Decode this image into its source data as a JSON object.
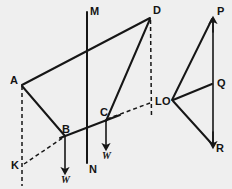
{
  "figure": {
    "background_color": "#efefef",
    "ink_color": "#161616",
    "width": 232,
    "height": 189,
    "labels": {
      "a": "A",
      "b": "B",
      "c": "C",
      "d": "D",
      "k": "K",
      "l": "L",
      "m": "M",
      "n": "N",
      "o": "O",
      "p": "P",
      "q": "Q",
      "r": "R",
      "w_left": "W",
      "w_right": "W"
    },
    "points": {
      "A": [
        22,
        85
      ],
      "B": [
        65,
        136
      ],
      "C": [
        106,
        120
      ],
      "D": [
        150,
        17
      ],
      "K": [
        22,
        165
      ],
      "L": [
        151,
        102
      ],
      "M": [
        87,
        12
      ],
      "N": [
        87,
        163
      ],
      "O": [
        172,
        100
      ],
      "P": [
        213,
        18
      ],
      "Q": [
        213,
        83
      ],
      "R": [
        213,
        145
      ]
    },
    "segments": [
      {
        "name": "A-D",
        "from": "A",
        "to": "D",
        "style": "solid"
      },
      {
        "name": "A-B",
        "from": "A",
        "to": "B",
        "style": "solid"
      },
      {
        "name": "B-C-extended",
        "from": "B",
        "to": "C",
        "style": "solid"
      },
      {
        "name": "C-D",
        "from": "C",
        "to": "D",
        "style": "solid"
      },
      {
        "name": "M-N",
        "from": "M",
        "to": "N",
        "style": "solid"
      },
      {
        "name": "K-B",
        "from": "K",
        "to": "B",
        "style": "dashed"
      },
      {
        "name": "C-L",
        "from": "C",
        "to": "L",
        "style": "dashed"
      },
      {
        "name": "A-K",
        "from": "A",
        "to": "K",
        "style": "dashed"
      },
      {
        "name": "D-L",
        "from": "D",
        "to": "L",
        "style": "dashed"
      },
      {
        "name": "O-P",
        "from": "O",
        "to": "P",
        "style": "solid"
      },
      {
        "name": "O-Q",
        "from": "O",
        "to": "Q",
        "style": "solid"
      },
      {
        "name": "O-R",
        "from": "O",
        "to": "R",
        "style": "solid"
      },
      {
        "name": "P-R",
        "from": "P",
        "to": "R",
        "style": "solid"
      }
    ],
    "force_arrows": [
      {
        "name": "weight-at-B",
        "from": [
          65,
          136
        ],
        "to": [
          65,
          172
        ],
        "label": "W"
      },
      {
        "name": "weight-at-C",
        "from": [
          106,
          120
        ],
        "to": [
          106,
          148
        ],
        "label": "W"
      }
    ]
  }
}
